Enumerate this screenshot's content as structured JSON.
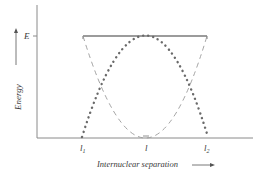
{
  "diagram": {
    "y_axis_label": "Energy",
    "y_axis_arrow": "up",
    "x_axis_label": "Internuclear separation",
    "x_axis_arrow": "right",
    "energy_level_label": "E",
    "x_ticks": [
      {
        "label": "l",
        "sub": "1",
        "x": 83
      },
      {
        "label": "l",
        "sub": "",
        "x": 146
      },
      {
        "label": "l",
        "sub": "2",
        "x": 207
      }
    ],
    "curves": [
      {
        "name": "energy-level-line",
        "style": "solid",
        "description": "constant total energy E between l1 and l2"
      },
      {
        "name": "kinetic-energy-curve",
        "style": "dotted",
        "description": "inverted parabola, max E at l, zero at l1 and l2"
      },
      {
        "name": "potential-energy-curve",
        "style": "dashed",
        "description": "parabola, min at l, equals E at l1 and l2"
      }
    ],
    "colors": {
      "axis": "#8a8a8a",
      "solid": "#7a7a7a",
      "dotted": "#6a6a6a",
      "dashed": "#9a9a9a",
      "text": "#3a3a3a"
    }
  }
}
